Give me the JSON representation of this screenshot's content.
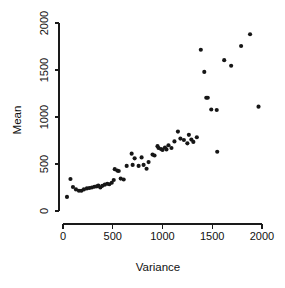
{
  "chart_data": {
    "type": "scatter",
    "title": "",
    "xlabel": "Variance",
    "ylabel": "Mean",
    "xlim": [
      -60,
      2120
    ],
    "ylim": [
      -90,
      2120
    ],
    "xticks": [
      0,
      500,
      1000,
      1500,
      2000
    ],
    "xticklabels": [
      "0",
      "500",
      "1000",
      "1500",
      "2000"
    ],
    "yticks": [
      0,
      500,
      1000,
      1500,
      2000
    ],
    "yticklabels": [
      "0",
      "500",
      "1000",
      "1500",
      "2000"
    ],
    "grid": false,
    "legend": null,
    "marker": "filled-circle",
    "marker_color": "#161616",
    "marker_size_px": 3.0,
    "points": [
      [
        40,
        150
      ],
      [
        75,
        340
      ],
      [
        100,
        255
      ],
      [
        130,
        230
      ],
      [
        160,
        215
      ],
      [
        185,
        215
      ],
      [
        210,
        230
      ],
      [
        240,
        240
      ],
      [
        265,
        245
      ],
      [
        290,
        250
      ],
      [
        315,
        258
      ],
      [
        340,
        262
      ],
      [
        355,
        270
      ],
      [
        375,
        250
      ],
      [
        395,
        268
      ],
      [
        420,
        280
      ],
      [
        445,
        290
      ],
      [
        465,
        285
      ],
      [
        490,
        300
      ],
      [
        510,
        330
      ],
      [
        520,
        445
      ],
      [
        545,
        430
      ],
      [
        560,
        425
      ],
      [
        580,
        345
      ],
      [
        610,
        335
      ],
      [
        640,
        480
      ],
      [
        690,
        610
      ],
      [
        700,
        490
      ],
      [
        720,
        560
      ],
      [
        760,
        480
      ],
      [
        790,
        570
      ],
      [
        810,
        490
      ],
      [
        840,
        450
      ],
      [
        860,
        520
      ],
      [
        900,
        600
      ],
      [
        920,
        590
      ],
      [
        950,
        690
      ],
      [
        960,
        670
      ],
      [
        985,
        660
      ],
      [
        1000,
        650
      ],
      [
        1025,
        675
      ],
      [
        1040,
        655
      ],
      [
        1060,
        700
      ],
      [
        1090,
        670
      ],
      [
        1120,
        740
      ],
      [
        1155,
        845
      ],
      [
        1180,
        770
      ],
      [
        1215,
        755
      ],
      [
        1250,
        720
      ],
      [
        1265,
        810
      ],
      [
        1290,
        760
      ],
      [
        1310,
        735
      ],
      [
        1345,
        785
      ],
      [
        1385,
        1715
      ],
      [
        1420,
        1480
      ],
      [
        1440,
        1205
      ],
      [
        1455,
        1205
      ],
      [
        1490,
        1080
      ],
      [
        1545,
        1075
      ],
      [
        1550,
        630
      ],
      [
        1620,
        1605
      ],
      [
        1690,
        1545
      ],
      [
        1790,
        1755
      ],
      [
        1880,
        1880
      ],
      [
        1965,
        1110
      ]
    ]
  }
}
